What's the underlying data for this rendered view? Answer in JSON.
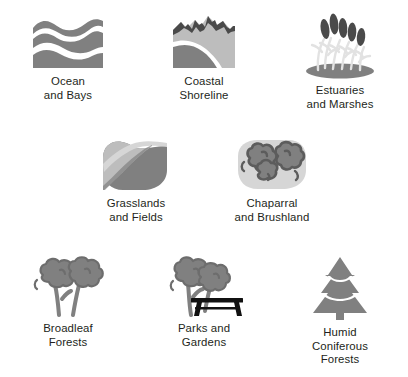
{
  "legend": {
    "title": "Habitat Types",
    "palette": {
      "mid_gray": "#808080",
      "light_gray": "#bdbdbd",
      "pale_gray": "#d6d6d6",
      "dark_gray": "#4a4a4a",
      "near_black": "#111111",
      "text": "#231f20",
      "background": "#ffffff"
    },
    "items": [
      {
        "id": "ocean-and-bays",
        "icon": "ocean-waves-icon",
        "label": "Ocean\nand Bays",
        "line1": "Ocean",
        "line2": "and Bays"
      },
      {
        "id": "coastal-shoreline",
        "icon": "coastal-cliff-icon",
        "label": "Coastal\nShoreline",
        "line1": "Coastal",
        "line2": "Shoreline"
      },
      {
        "id": "estuaries-and-marshes",
        "icon": "cattail-marsh-icon",
        "label": "Estuaries\nand Marshes",
        "line1": "Estuaries",
        "line2": "and Marshes"
      },
      {
        "id": "grasslands-and-fields",
        "icon": "rolling-hill-icon",
        "label": "Grasslands\nand Fields",
        "line1": "Grasslands",
        "line2": "and Fields"
      },
      {
        "id": "chaparral-and-brushland",
        "icon": "shrub-cluster-icon",
        "label": "Chaparral\nand Brushland",
        "line1": "Chaparral",
        "line2": "and Brushland"
      },
      {
        "id": "broadleaf-forests",
        "icon": "broadleaf-trees-icon",
        "label": "Broadleaf\nForests",
        "line1": "Broadleaf",
        "line2": "Forests"
      },
      {
        "id": "parks-and-gardens",
        "icon": "tree-with-bench-icon",
        "label": "Parks and\nGardens",
        "line1": "Parks and",
        "line2": "Gardens"
      },
      {
        "id": "humid-coniferous-forests",
        "icon": "conifer-tree-icon",
        "label": "Humid\nConiferous\nForests",
        "line1": "Humid",
        "line2": "Coniferous",
        "line3": "Forests"
      }
    ]
  }
}
